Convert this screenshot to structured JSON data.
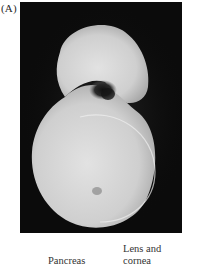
{
  "figure": {
    "panel_label": "(A)",
    "image_description": "Embryo photograph on black background with dark-stained region",
    "labels": {
      "pancreas": "Pancreas",
      "lens_line1": "Lens and",
      "lens_line2": "cornea"
    }
  }
}
